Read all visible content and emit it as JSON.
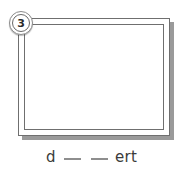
{
  "item": {
    "number": "3",
    "badge_icon": "circle-number-badge"
  },
  "frame": {
    "name": "empty-picture-frame",
    "content": "",
    "border_color": "#6f6f6f",
    "shadow_color": "#9a9a9a",
    "fill_color": "#ffffff"
  },
  "caption": {
    "full_text": "d __ __ ert",
    "prefix": "d",
    "suffix": "ert",
    "blank_count": 2,
    "text_color": "#3b3b3b",
    "blank_color": "#8e8e8e"
  }
}
